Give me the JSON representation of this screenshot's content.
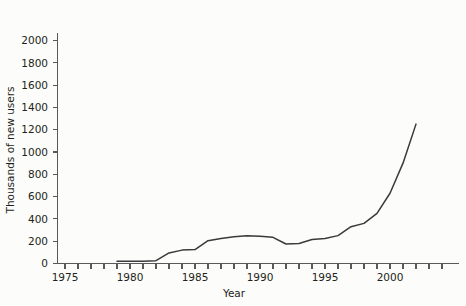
{
  "chart_data": {
    "type": "line",
    "title": "",
    "xlabel": "Year",
    "ylabel": "Thousands of new users",
    "xlim": [
      1974,
      2003
    ],
    "ylim": [
      0,
      2100
    ],
    "grid": false,
    "legend": null,
    "x_major_ticks": [
      1975,
      1980,
      1985,
      1990,
      1995,
      2000
    ],
    "x_minor_tick_step": 1,
    "y_ticks": [
      0,
      200,
      400,
      600,
      800,
      1000,
      1200,
      1400,
      1600,
      1800,
      2000
    ],
    "y_tick_labels": [
      "0",
      "200",
      "400",
      "600",
      "800",
      "1000",
      "1200",
      "1400",
      "1600",
      "1800",
      "2000"
    ],
    "x_tick_labels": [
      "1975",
      "1980",
      "1985",
      "1990",
      "1995",
      "2000"
    ],
    "series": [
      {
        "name": "New users",
        "x": [
          1979,
          1980,
          1981,
          1982,
          1983,
          1984,
          1985,
          1986,
          1987,
          1988,
          1989,
          1990,
          1991,
          1992,
          1993,
          1994,
          1995,
          1996,
          1997,
          1998,
          1999,
          2000,
          2001,
          2002
        ],
        "values": [
          20,
          20,
          20,
          25,
          95,
          120,
          125,
          205,
          225,
          240,
          250,
          245,
          235,
          175,
          180,
          215,
          225,
          250,
          330,
          360,
          450,
          630,
          900,
          1250
        ]
      }
    ]
  },
  "axis": {
    "y_title": "Thousands of new users",
    "x_title": "Year"
  }
}
